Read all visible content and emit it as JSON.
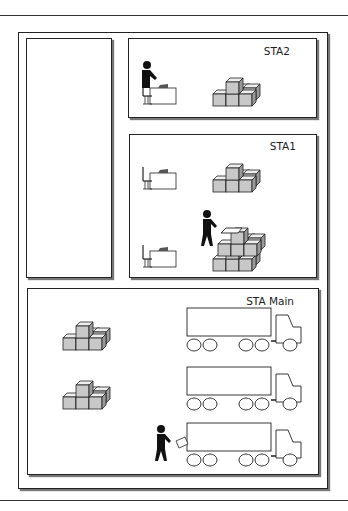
{
  "diagram": {
    "stations": [
      {
        "id": "sta2",
        "label": "STA2",
        "contents": [
          "worker at desk",
          "stack of boxes"
        ]
      },
      {
        "id": "sta1",
        "label": "STA1",
        "contents": [
          "empty desk",
          "stack of boxes",
          "worker packing boxes",
          "empty desk",
          "stack of boxes"
        ]
      },
      {
        "id": "sta-main",
        "label": "STA Main",
        "contents": [
          "stack of boxes",
          "stack of boxes",
          "truck",
          "truck",
          "worker loading truck",
          "truck"
        ]
      }
    ],
    "left_panel": {
      "label": ""
    },
    "colors": {
      "box_fill": "#c8c8c8",
      "stroke": "#222222",
      "figure": "#111111"
    }
  }
}
